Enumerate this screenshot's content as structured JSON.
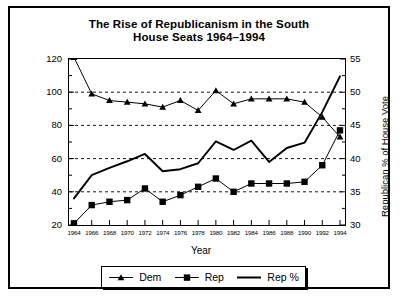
{
  "chart_data": {
    "type": "line",
    "title": "The Rise of Republicanism in the South",
    "subtitle": "House Seats 1964–1994",
    "xlabel": "Year",
    "ylabel": "Seats",
    "ylabel_right": "Republican % of House Vote",
    "x": [
      1964,
      1966,
      1968,
      1970,
      1972,
      1974,
      1976,
      1978,
      1980,
      1982,
      1984,
      1986,
      1988,
      1990,
      1992,
      1994
    ],
    "xtick_labels": [
      "1964",
      "1966",
      "1968",
      "1970",
      "1972",
      "1974",
      "1976",
      "1978",
      "1980",
      "1982",
      "1984",
      "1986",
      "1988",
      "1990",
      "1992",
      "1994"
    ],
    "ylim": [
      20,
      120
    ],
    "yticks": [
      20,
      40,
      60,
      80,
      100,
      120
    ],
    "ylim_right": [
      30,
      55
    ],
    "yticks_right": [
      30,
      35,
      40,
      45,
      50,
      55
    ],
    "grid": true,
    "grid_style": "dashed-horizontal",
    "legend_position": "bottom",
    "series": [
      {
        "name": "Dem",
        "marker": "triangle",
        "axis": "left",
        "values": [
          121,
          99,
          95,
          94,
          93,
          91,
          95,
          89,
          101,
          93,
          96,
          96,
          96,
          94,
          85,
          73
        ]
      },
      {
        "name": "Rep",
        "marker": "square",
        "axis": "left",
        "values": [
          21,
          32,
          34,
          35,
          42,
          34,
          38,
          43,
          48,
          40,
          45,
          45,
          45,
          46,
          56,
          77
        ]
      },
      {
        "name": "Rep %",
        "marker": "none",
        "axis": "right",
        "values": [
          34.0,
          37.5,
          38.6,
          39.6,
          40.7,
          38.1,
          38.4,
          39.3,
          42.6,
          41.3,
          42.7,
          39.5,
          41.6,
          42.4,
          47.0,
          52.4
        ]
      }
    ]
  },
  "legend": {
    "items": [
      {
        "label": "Dem",
        "marker": "triangle"
      },
      {
        "label": "Rep",
        "marker": "square"
      },
      {
        "label": "Rep %",
        "marker": "line"
      }
    ]
  }
}
